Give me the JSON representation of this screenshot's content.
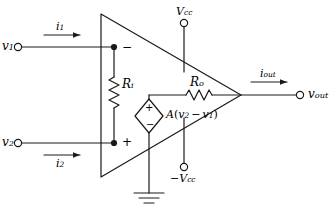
{
  "diagram": {
    "type": "circuit-schematic",
    "stroke_color": "#1a1a1a",
    "background_color": "#ffffff"
  },
  "terminals": {
    "input1": {
      "label_main": "v",
      "label_sub": "1",
      "node_symbol": "open-circle"
    },
    "input2": {
      "label_main": "v",
      "label_sub": "2",
      "node_symbol": "open-circle"
    },
    "output": {
      "label_main": "v",
      "label_sub": "out",
      "node_symbol": "open-circle"
    },
    "supply_positive": {
      "label_main": "V",
      "label_sub": "cc",
      "node_symbol": "open-circle"
    },
    "supply_negative": {
      "label_main": "−V",
      "label_sub": "cc",
      "node_symbol": "open-circle"
    }
  },
  "currents": {
    "i1": {
      "label_main": "i",
      "label_sub": "1",
      "direction": "right"
    },
    "i2": {
      "label_main": "i",
      "label_sub": "2",
      "direction": "right"
    },
    "iout": {
      "label_main": "i",
      "label_sub": "out",
      "direction": "right"
    }
  },
  "components": {
    "input_resistance": {
      "label_main": "R",
      "label_sub": "i",
      "orientation": "vertical"
    },
    "output_resistance": {
      "label_main": "R",
      "label_sub": "o",
      "orientation": "horizontal"
    },
    "dependent_source": {
      "label": "A(v₂ − v₁)",
      "label_parts": {
        "gain": "A",
        "open": "(",
        "v2": "v",
        "v2_sub": "2",
        "minus": "−",
        "v1": "v",
        "v1_sub": "1",
        "close": ")"
      },
      "shape": "diamond",
      "polarity_top": "+",
      "polarity_bottom": "−"
    },
    "ground": {
      "symbol": "earth-ground",
      "bars": 3
    }
  },
  "input_polarity": {
    "inverting": "−",
    "noninverting": "+"
  }
}
